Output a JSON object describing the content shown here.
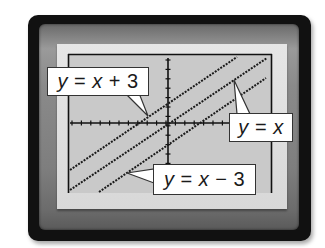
{
  "graph": {
    "lines": [
      {
        "equation": "y = x + 3",
        "slope": 1,
        "intercept": 3,
        "x1": 70,
        "y1": 170,
        "x2": 237,
        "y2": 57
      },
      {
        "equation": "y = x",
        "slope": 1,
        "intercept": 0,
        "x1": 70,
        "y1": 190,
        "x2": 267,
        "y2": 58
      },
      {
        "equation": "y = x - 3",
        "slope": 1,
        "intercept": -3,
        "x1": 99,
        "y1": 192,
        "x2": 266,
        "y2": 78
      }
    ],
    "labels": {
      "line1": {
        "lhs": "y",
        "op": " = ",
        "rhs_var": "x",
        "rhs_rest": " + 3"
      },
      "line2": {
        "lhs": "y",
        "op": " = ",
        "rhs_var": "x",
        "rhs_rest": ""
      },
      "line3": {
        "lhs": "y",
        "op": " = ",
        "rhs_var": "x",
        "rhs_rest": " − 3"
      }
    },
    "colors": {
      "frame": "#111111",
      "lcd": "#c8c8c8",
      "line": "#1a1a1a",
      "label_bg": "#ffffff"
    }
  }
}
